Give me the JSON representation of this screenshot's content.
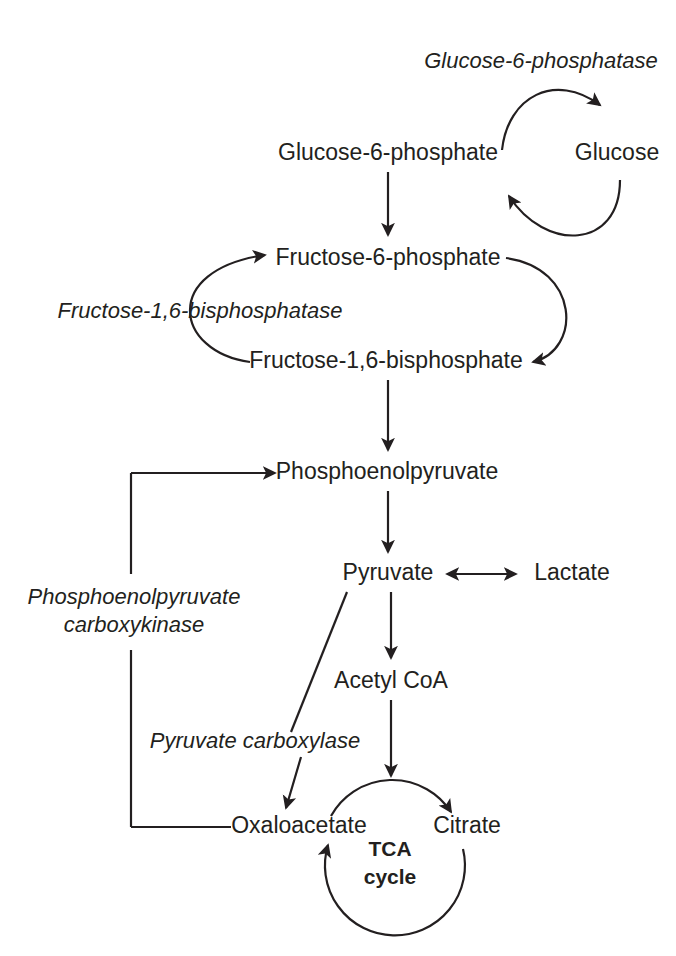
{
  "figure": {
    "kind": "metabolic-pathway-diagram",
    "ink_color": "#231f20",
    "background_color": "#ffffff"
  },
  "metabolites": [
    {
      "id": "glucose6phosphate",
      "label": "Glucose-6-phosphate",
      "x": 388,
      "y": 160
    },
    {
      "id": "glucose",
      "label": "Glucose",
      "x": 617,
      "y": 160
    },
    {
      "id": "fructose6phosphate",
      "label": "Fructose-6-phosphate",
      "x": 388,
      "y": 265
    },
    {
      "id": "fructose16bisphosphate",
      "label": "Fructose-1,6-bisphosphate",
      "x": 386,
      "y": 368
    },
    {
      "id": "phosphoenolpyruvate",
      "label": "Phosphoenolpyruvate",
      "x": 387,
      "y": 479
    },
    {
      "id": "pyruvate",
      "label": "Pyruvate",
      "x": 388,
      "y": 580
    },
    {
      "id": "lactate",
      "label": "Lactate",
      "x": 572,
      "y": 580
    },
    {
      "id": "acetylcoa",
      "label": "Acetyl CoA",
      "x": 391,
      "y": 688
    },
    {
      "id": "oxaloacetate",
      "label": "Oxaloacetate",
      "x": 299,
      "y": 833
    },
    {
      "id": "citrate",
      "label": "Citrate",
      "x": 467,
      "y": 833
    }
  ],
  "enzymes": [
    {
      "id": "glucose6phosphatase",
      "label": "Glucose-6-phosphatase",
      "x": 541,
      "y": 68
    },
    {
      "id": "fructose16bisphosphatase",
      "label": "Fructose-1,6-bisphosphatase",
      "x": 200,
      "y": 318
    },
    {
      "id": "pepck_line1",
      "label": "Phosphoenolpyruvate",
      "x": 134,
      "y": 604
    },
    {
      "id": "pepck_line2",
      "label": "carboxykinase",
      "x": 134,
      "y": 632
    },
    {
      "id": "pyruvate_carboxylase",
      "label": "Pyruvate carboxylase",
      "x": 255,
      "y": 748
    }
  ],
  "cycle": {
    "id": "tca-cycle",
    "line1": "TCA",
    "line2": "cycle",
    "center_x": 395,
    "center_y": 856,
    "radius": 70
  },
  "reactions": [
    {
      "id": "g6p-to-glucose",
      "from": "Glucose-6-phosphate",
      "to": "Glucose",
      "enzyme": "Glucose-6-phosphatase",
      "direction": "forward"
    },
    {
      "id": "glucose-to-g6p",
      "from": "Glucose",
      "to": "Glucose-6-phosphate",
      "direction": "forward"
    },
    {
      "id": "g6p-to-f6p",
      "from": "Glucose-6-phosphate",
      "to": "Fructose-6-phosphate",
      "direction": "forward"
    },
    {
      "id": "f16bp-to-f6p",
      "from": "Fructose-1,6-bisphosphate",
      "to": "Fructose-6-phosphate",
      "enzyme": "Fructose-1,6-bisphosphatase",
      "direction": "forward"
    },
    {
      "id": "f6p-to-f16bp",
      "from": "Fructose-6-phosphate",
      "to": "Fructose-1,6-bisphosphate",
      "direction": "forward"
    },
    {
      "id": "f16bp-to-pep",
      "from": "Fructose-1,6-bisphosphate",
      "to": "Phosphoenolpyruvate",
      "direction": "forward"
    },
    {
      "id": "pep-to-pyruvate",
      "from": "Phosphoenolpyruvate",
      "to": "Pyruvate",
      "direction": "forward"
    },
    {
      "id": "pyruvate-lactate",
      "from": "Pyruvate",
      "to": "Lactate",
      "direction": "reversible"
    },
    {
      "id": "pyruvate-to-acetylcoa",
      "from": "Pyruvate",
      "to": "Acetyl CoA",
      "direction": "forward"
    },
    {
      "id": "pyruvate-to-oxaloacetate",
      "from": "Pyruvate",
      "to": "Oxaloacetate",
      "enzyme": "Pyruvate carboxylase",
      "direction": "forward"
    },
    {
      "id": "oaa-to-pep",
      "from": "Oxaloacetate",
      "to": "Phosphoenolpyruvate",
      "enzyme": "Phosphoenolpyruvate carboxykinase",
      "direction": "forward"
    },
    {
      "id": "acetylcoa-to-tca",
      "from": "Acetyl CoA",
      "to": "TCA cycle",
      "direction": "forward"
    },
    {
      "id": "oaa-to-citrate",
      "from": "Oxaloacetate",
      "to": "Citrate",
      "direction": "forward"
    },
    {
      "id": "citrate-to-oaa",
      "from": "Citrate",
      "to": "Oxaloacetate",
      "direction": "forward"
    }
  ]
}
